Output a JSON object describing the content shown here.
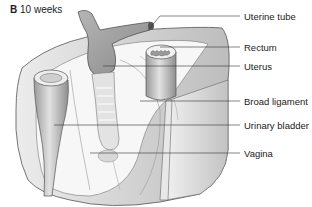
{
  "figure": {
    "panel_letter": "B",
    "panel_caption": "10 weeks"
  },
  "labels": [
    {
      "id": "uterine-tube",
      "text": "Uterine tube",
      "y": 16,
      "line_from_x": 148,
      "line_from_y": 30
    },
    {
      "id": "rectum",
      "text": "Rectum",
      "y": 47,
      "line_from_x": 160,
      "line_from_y": 47
    },
    {
      "id": "uterus",
      "text": "Uterus",
      "y": 66,
      "line_from_x": 103,
      "line_from_y": 66
    },
    {
      "id": "broad-ligament",
      "text": "Broad ligament",
      "y": 101,
      "line_from_x": 140,
      "line_from_y": 101
    },
    {
      "id": "urinary-bladder",
      "text": "Urinary bladder",
      "y": 125,
      "line_from_x": 54,
      "line_from_y": 125
    },
    {
      "id": "vagina",
      "text": "Vagina",
      "y": 153,
      "line_from_x": 90,
      "line_from_y": 153
    }
  ],
  "colors": {
    "outline": "#555555",
    "tissue_light": "#f2f2f2",
    "tissue_mid": "#d6d6d6",
    "tissue_dark": "#a8a8a8",
    "label_line": "#333333"
  }
}
